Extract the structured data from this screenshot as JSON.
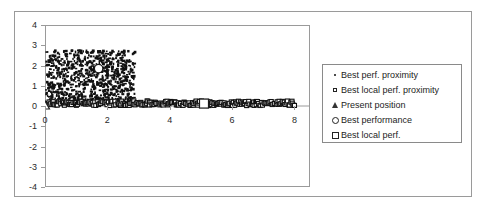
{
  "chart_data": {
    "type": "scatter",
    "title": "",
    "xlabel": "",
    "ylabel": "",
    "xlim": [
      0,
      8.5
    ],
    "ylim": [
      -4,
      4
    ],
    "xticks": [
      "0",
      "2",
      "4",
      "6",
      "8"
    ],
    "xtick_values": [
      0,
      2,
      4,
      6,
      8
    ],
    "yticks": [
      "4",
      "3",
      "2",
      "1",
      "0",
      "-1",
      "-2",
      "-3",
      "-4"
    ],
    "ytick_values": [
      4,
      3,
      2,
      1,
      0,
      -1,
      -2,
      -3,
      -4
    ],
    "grid": false,
    "legend_position": "right-outside",
    "series": [
      {
        "name": "Best perf. proximity",
        "marker": "dot",
        "description": "Dense black point cloud spanning x 0 to 2.85, y 0.1 to 2.8",
        "x_range": [
          0.0,
          2.85
        ],
        "y_range": [
          0.1,
          2.8
        ],
        "point_count": 900
      },
      {
        "name": "Best local perf. proximity",
        "marker": "small-square",
        "description": "Dense band of small open squares along y near 0.1 spanning x 0 to 8",
        "x_range": [
          0.0,
          8.0
        ],
        "y_range": [
          0.02,
          0.25
        ],
        "point_count": 260
      },
      {
        "name": "Present position",
        "marker": "triangle",
        "description": "Single triangle marker at the origin",
        "points": [
          [
            0.0,
            0.0
          ]
        ]
      },
      {
        "name": "Best performance",
        "marker": "circle",
        "description": "Single open circle marker inside the point cloud",
        "points": [
          [
            1.72,
            1.85
          ]
        ]
      },
      {
        "name": "Best local perf.",
        "marker": "square",
        "description": "Single open square marker on the low band",
        "points": [
          [
            5.1,
            0.12
          ]
        ]
      }
    ]
  },
  "legend": {
    "items": [
      {
        "marker": "dot",
        "label": "Best perf. proximity"
      },
      {
        "marker": "small-square",
        "label": "Best local perf. proximity"
      },
      {
        "marker": "triangle",
        "label": "Present position"
      },
      {
        "marker": "circle",
        "label": "Best performance"
      },
      {
        "marker": "square",
        "label": "Best local perf."
      }
    ]
  }
}
